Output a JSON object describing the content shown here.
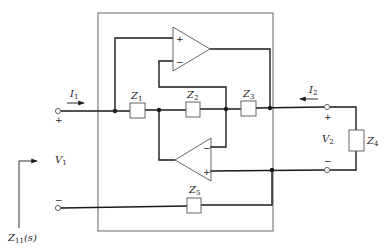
{
  "diagram": {
    "type": "circuit-schematic",
    "colors": {
      "wire": "#1a1a1a",
      "box": "#555555",
      "background": "#ffffff"
    },
    "impedances": [
      {
        "id": "Z1",
        "base": "Z",
        "sub": "1"
      },
      {
        "id": "Z2",
        "base": "Z",
        "sub": "2"
      },
      {
        "id": "Z3",
        "base": "Z",
        "sub": "3"
      },
      {
        "id": "Z4",
        "base": "Z",
        "sub": "4"
      },
      {
        "id": "Z5",
        "base": "Z",
        "sub": "5"
      }
    ],
    "opamps": [
      {
        "id": "A1",
        "position": "top",
        "plus": "+",
        "minus": "−"
      },
      {
        "id": "A2",
        "position": "bottom",
        "plus": "+",
        "minus": "−"
      }
    ],
    "port1": {
      "current": {
        "base": "I",
        "sub": "1"
      },
      "voltage": {
        "base": "V",
        "sub": "1"
      },
      "plus": "+",
      "minus": "−"
    },
    "port2": {
      "current": {
        "base": "I",
        "sub": "2"
      },
      "voltage": {
        "base": "V",
        "sub": "2"
      },
      "plus": "+",
      "minus": "−"
    },
    "input_impedance": {
      "base": "Z",
      "sub": "11",
      "arg": "(s)"
    }
  }
}
